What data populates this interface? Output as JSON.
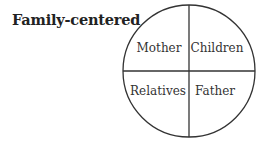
{
  "title": "Family-centered",
  "diagram": {
    "type": "circle-quadrants",
    "quadrants": [
      {
        "position": "top-left",
        "label": "Mother"
      },
      {
        "position": "top-right",
        "label": "Children"
      },
      {
        "position": "bottom-left",
        "label": "Relatives"
      },
      {
        "position": "bottom-right",
        "label": "Father"
      }
    ]
  }
}
